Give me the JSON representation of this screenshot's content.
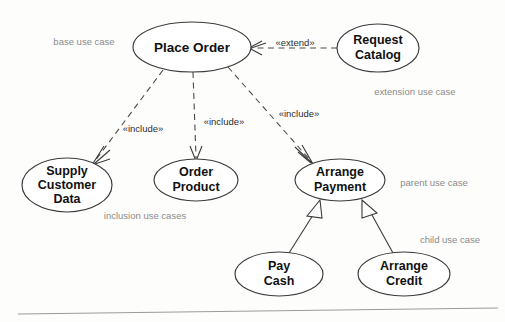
{
  "diagram": {
    "type": "use-case-diagram",
    "background_color": "#fdfdfc",
    "node_stroke_color": "#3b3b3b",
    "annotation_color": "#8a8a8a",
    "use_cases": [
      {
        "id": "place-order",
        "line1": "Place Order",
        "line2": "",
        "cx": 192,
        "cy": 47,
        "rx": 59,
        "ry": 25
      },
      {
        "id": "request-catalog",
        "line1": "Request",
        "line2": "Catalog",
        "cx": 378,
        "cy": 48,
        "rx": 41,
        "ry": 24
      },
      {
        "id": "supply-customer-data",
        "line1": "Supply",
        "line2": "Customer",
        "line3": "Data",
        "cx": 67,
        "cy": 185,
        "rx": 45,
        "ry": 27
      },
      {
        "id": "order-product",
        "line1": "Order",
        "line2": "Product",
        "cx": 196,
        "cy": 180,
        "rx": 42,
        "ry": 21
      },
      {
        "id": "arrange-payment",
        "line1": "Arrange",
        "line2": "Payment",
        "cx": 340,
        "cy": 180,
        "rx": 45,
        "ry": 21
      },
      {
        "id": "pay-cash",
        "line1": "Pay",
        "line2": "Cash",
        "cx": 279,
        "cy": 274,
        "rx": 44,
        "ry": 22
      },
      {
        "id": "arrange-credit",
        "line1": "Arrange",
        "line2": "Credit",
        "cx": 404,
        "cy": 274,
        "rx": 46,
        "ry": 22
      }
    ],
    "relationships": [
      {
        "id": "extend-request-catalog",
        "stereotype": "«extend»",
        "style": "dashed",
        "from": "request-catalog",
        "to": "place-order",
        "label_x": 295,
        "label_y": 43
      },
      {
        "id": "include-supply-customer-data",
        "stereotype": "«include»",
        "style": "dashed",
        "from": "place-order",
        "to": "supply-customer-data",
        "label_x": 143,
        "label_y": 129
      },
      {
        "id": "include-order-product",
        "stereotype": "«include»",
        "style": "dashed",
        "from": "place-order",
        "to": "order-product",
        "label_x": 224,
        "label_y": 122
      },
      {
        "id": "include-arrange-payment",
        "stereotype": "«include»",
        "style": "dashed",
        "from": "place-order",
        "to": "arrange-payment",
        "label_x": 299,
        "label_y": 114
      },
      {
        "id": "generalization-pay-cash",
        "stereotype": "",
        "style": "solid",
        "from": "pay-cash",
        "to": "arrange-payment",
        "label_x": 0,
        "label_y": 0
      },
      {
        "id": "generalization-arrange-credit",
        "stereotype": "",
        "style": "solid",
        "from": "arrange-credit",
        "to": "arrange-payment",
        "label_x": 0,
        "label_y": 0
      }
    ],
    "annotations": [
      {
        "id": "base-use-case",
        "text": "base use case",
        "x": 84,
        "y": 42
      },
      {
        "id": "extension-use-case",
        "text": "extension use case",
        "x": 415,
        "y": 92
      },
      {
        "id": "inclusion-use-cases",
        "text": "inclusion use cases",
        "x": 145,
        "y": 216
      },
      {
        "id": "parent-use-case",
        "text": "parent use case",
        "x": 434,
        "y": 183
      },
      {
        "id": "child-use-case",
        "text": "child use case",
        "x": 450,
        "y": 240
      }
    ]
  }
}
